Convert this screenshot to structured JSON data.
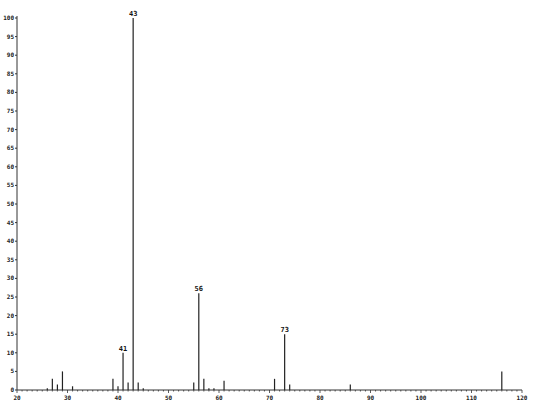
{
  "chart_data": {
    "type": "bar",
    "title": "",
    "xlabel": "",
    "ylabel": "",
    "xlim": [
      20,
      120
    ],
    "ylim": [
      0,
      100
    ],
    "grid": false,
    "legend": null,
    "x_ticks": [
      20,
      30,
      40,
      50,
      60,
      70,
      80,
      90,
      100,
      110,
      120
    ],
    "y_ticks": [
      0,
      5,
      10,
      15,
      20,
      25,
      30,
      35,
      40,
      45,
      50,
      55,
      60,
      65,
      70,
      75,
      80,
      85,
      90,
      95,
      100
    ],
    "x": [
      26,
      27,
      28,
      29,
      31,
      39,
      40,
      41,
      42,
      43,
      44,
      45,
      55,
      56,
      57,
      58,
      59,
      61,
      71,
      73,
      74,
      86,
      116
    ],
    "values": [
      0.5,
      3,
      1.5,
      5,
      1,
      3,
      1,
      10,
      2,
      100,
      2,
      0.5,
      2,
      26,
      3,
      0.5,
      0.5,
      2.5,
      3,
      15,
      1.5,
      1.5,
      5
    ],
    "annotations": [
      {
        "x": 41,
        "label": "41"
      },
      {
        "x": 43,
        "label": "43"
      },
      {
        "x": 56,
        "label": "56"
      },
      {
        "x": 73,
        "label": "73"
      }
    ]
  },
  "colors": {
    "axis": "#333333",
    "bar": "#222222",
    "background": "#ffffff"
  }
}
